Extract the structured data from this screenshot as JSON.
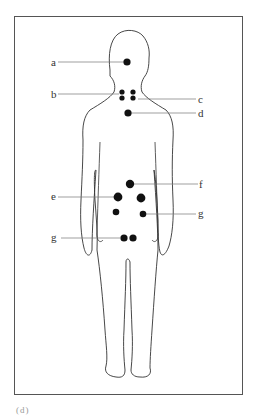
{
  "figure": {
    "type": "body-diagram",
    "caption_fragment": "(d)"
  },
  "labels": [
    {
      "id": "a",
      "text": "a",
      "side": "left",
      "x": 51,
      "y": 57
    },
    {
      "id": "b",
      "text": "b",
      "side": "left",
      "x": 51,
      "y": 89
    },
    {
      "id": "c",
      "text": "c",
      "side": "right",
      "x": 198,
      "y": 94
    },
    {
      "id": "d",
      "text": "d",
      "side": "right",
      "x": 198,
      "y": 108
    },
    {
      "id": "f",
      "text": "f",
      "side": "right",
      "x": 199,
      "y": 179
    },
    {
      "id": "e",
      "text": "e",
      "side": "left",
      "x": 51,
      "y": 191
    },
    {
      "id": "g1",
      "text": "g",
      "side": "right",
      "x": 198,
      "y": 208
    },
    {
      "id": "g2",
      "text": "g",
      "side": "left",
      "x": 51,
      "y": 232
    }
  ],
  "colors": {
    "outline": "#333333",
    "dot": "#111111",
    "leader": "#777777",
    "frame": "#555555"
  }
}
